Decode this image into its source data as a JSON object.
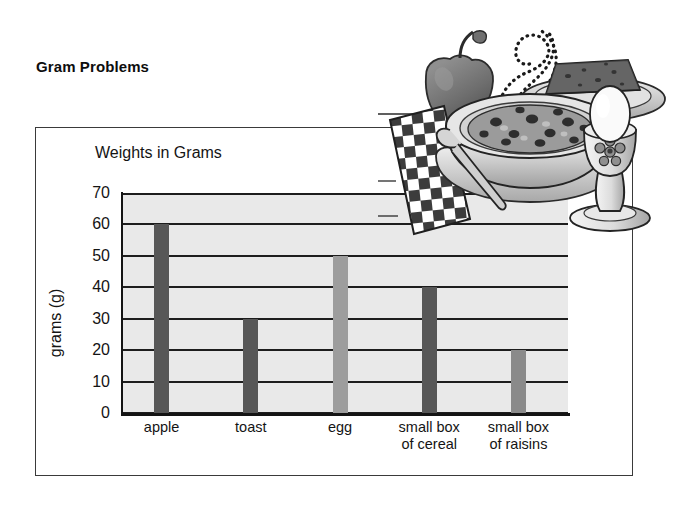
{
  "page": {
    "heading": "Gram Problems"
  },
  "chart_data": {
    "type": "bar",
    "title": "Weights in Grams",
    "xlabel": "",
    "ylabel": "grams (g)",
    "categories": [
      "apple",
      "toast",
      "egg",
      "small box\nof cereal",
      "small box\nof raisins"
    ],
    "category_lines": [
      [
        "apple"
      ],
      [
        "toast"
      ],
      [
        "egg"
      ],
      [
        "small box",
        "of cereal"
      ],
      [
        "small box",
        "of raisins"
      ]
    ],
    "values": [
      60,
      30,
      50,
      40,
      20
    ],
    "bar_colors": [
      "#575757",
      "#575757",
      "#9d9d9d",
      "#575757",
      "#8a8a8a"
    ],
    "ylim": [
      0,
      70
    ],
    "ytick_step": 10,
    "ytick_labels": [
      "70",
      "60",
      "50",
      "40",
      "30",
      "20",
      "10",
      "0"
    ],
    "grid": true,
    "grid_color": "#1d1d1d",
    "plot_background": "#e9e9e9",
    "legend": "none"
  },
  "illustration": {
    "name": "breakfast-scene",
    "elements": [
      "apple",
      "checkered-napkin",
      "bowl-of-cereal",
      "steam-swirls",
      "spoon",
      "toast-on-plate",
      "egg-in-egg-cup"
    ]
  },
  "colors": {
    "frame": "#3a3a3a",
    "axis": "#141414",
    "text": "#141414",
    "plot_bg": "#e9e9e9"
  }
}
